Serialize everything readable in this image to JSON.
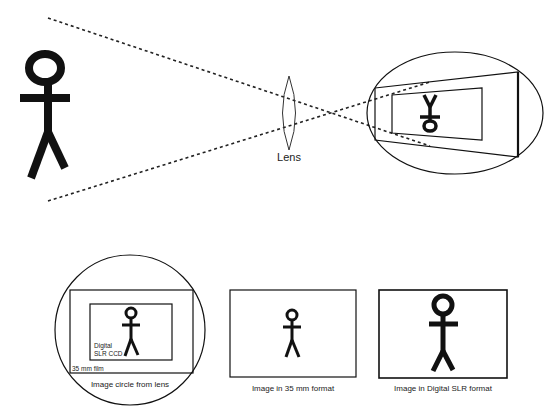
{
  "diagram": {
    "colors": {
      "ink": "#111111",
      "background": "#ffffff"
    },
    "top": {
      "subject": "stick-figure",
      "lens_label": "Lens",
      "projection": "inverted image inside image circle"
    },
    "bottom": {
      "panels": [
        {
          "caption": "Image circle from lens",
          "inner_labels": {
            "ccd": [
              "Digital",
              "SLR CCD"
            ],
            "film": "35 mm film"
          }
        },
        {
          "caption": "Image in 35 mm format"
        },
        {
          "caption": "Image in Digital SLR format"
        }
      ]
    }
  }
}
